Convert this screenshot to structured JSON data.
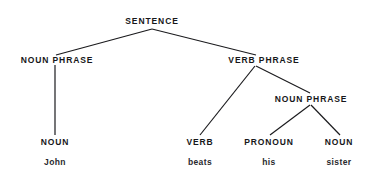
{
  "figure": {
    "kind": "syntax-parse-tree",
    "sentence": "John beats his sister",
    "background_color": "#ffffff",
    "line_color": "#1a1a1d",
    "text_color": "#17171a"
  },
  "nodes": [
    {
      "id": "s",
      "label": "SENTENCE",
      "x": 152,
      "y": 21
    },
    {
      "id": "np1",
      "label": "NOUN PHRASE",
      "x": 57,
      "y": 60
    },
    {
      "id": "vp",
      "label": "VERB PHRASE",
      "x": 264,
      "y": 60
    },
    {
      "id": "np2",
      "label": "NOUN PHRASE",
      "x": 311,
      "y": 99
    },
    {
      "id": "n1",
      "label": "NOUN",
      "x": 55,
      "y": 142
    },
    {
      "id": "v",
      "label": "VERB",
      "x": 200,
      "y": 142
    },
    {
      "id": "pron",
      "label": "PRONOUN",
      "x": 269,
      "y": 142
    },
    {
      "id": "n2",
      "label": "NOUN",
      "x": 339,
      "y": 142
    }
  ],
  "words": [
    {
      "id": "w1",
      "label": "John",
      "x": 55,
      "y": 162
    },
    {
      "id": "w2",
      "label": "beats",
      "x": 200,
      "y": 162
    },
    {
      "id": "w3",
      "label": "his",
      "x": 269,
      "y": 162
    },
    {
      "id": "w4",
      "label": "sister",
      "x": 339,
      "y": 162
    }
  ],
  "edges": [
    {
      "id": "s-np1",
      "from": "s",
      "to": "np1",
      "x1": 152,
      "y1": 29,
      "x2": 56,
      "y2": 55
    },
    {
      "id": "s-vp",
      "from": "s",
      "to": "vp",
      "x1": 152,
      "y1": 29,
      "x2": 256,
      "y2": 55
    },
    {
      "id": "np1-n1",
      "from": "np1",
      "to": "n1",
      "x1": 55,
      "y1": 65,
      "x2": 55,
      "y2": 135
    },
    {
      "id": "vp-v",
      "from": "vp",
      "to": "v",
      "x1": 255,
      "y1": 66,
      "x2": 200,
      "y2": 135
    },
    {
      "id": "vp-np2",
      "from": "vp",
      "to": "np2",
      "x1": 256,
      "y1": 66,
      "x2": 310,
      "y2": 93
    },
    {
      "id": "np2-pron",
      "from": "np2",
      "to": "pron",
      "x1": 310,
      "y1": 105,
      "x2": 270,
      "y2": 135
    },
    {
      "id": "np2-n2",
      "from": "np2",
      "to": "n2",
      "x1": 311,
      "y1": 105,
      "x2": 340,
      "y2": 135
    }
  ]
}
